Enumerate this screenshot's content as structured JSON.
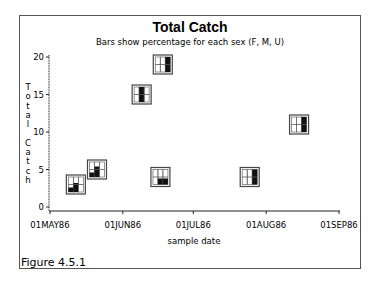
{
  "chart_data": {
    "type": "scatter",
    "marker_type": "mini bar chart (F, M, U percentages)",
    "title": "Total Catch",
    "subtitle": "Bars show percentage for each sex (F, M, U)",
    "xlabel": "sample date",
    "ylabel": "Total Catch",
    "x_ticks": [
      "01MAY86",
      "01JUN86",
      "01JUL86",
      "01AUG86",
      "01SEP86"
    ],
    "y_ticks": [
      0,
      5,
      10,
      15,
      20
    ],
    "ylim": [
      0,
      20
    ],
    "grid": false,
    "legend": "none",
    "categories_per_marker": [
      "F",
      "M",
      "U"
    ],
    "points": [
      {
        "date": "12MAY86",
        "total": 3,
        "pct": {
          "F": 30,
          "M": 60,
          "U": 0
        }
      },
      {
        "date": "21MAY86",
        "total": 5,
        "pct": {
          "F": 30,
          "M": 70,
          "U": 0
        }
      },
      {
        "date": "09JUN86",
        "total": 15,
        "pct": {
          "F": 0,
          "M": 100,
          "U": 0
        }
      },
      {
        "date": "17JUN86",
        "total": 4,
        "pct": {
          "F": 0,
          "M": 40,
          "U": 40
        }
      },
      {
        "date": "18JUN86",
        "total": 19,
        "pct": {
          "F": 0,
          "M": 0,
          "U": 100
        }
      },
      {
        "date": "25JUL86",
        "total": 4,
        "pct": {
          "F": 0,
          "M": 0,
          "U": 100
        }
      },
      {
        "date": "15AUG86",
        "total": 11,
        "pct": {
          "F": 0,
          "M": 0,
          "U": 100
        }
      }
    ]
  },
  "caption": "Figure 4.5.1",
  "ylabel_letters": [
    "T",
    "o",
    "t",
    "a",
    "l",
    " ",
    "C",
    "a",
    "t",
    "c",
    "h"
  ]
}
